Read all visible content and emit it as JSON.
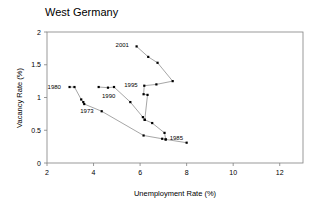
{
  "chart_data": {
    "type": "line",
    "title": "West Germany",
    "xlabel": "Unemployment Rate (%)",
    "ylabel": "Vacancy Rate (%)",
    "xlim": [
      2,
      13
    ],
    "ylim": [
      0,
      2
    ],
    "xticks": [
      2,
      4,
      6,
      8,
      10,
      12
    ],
    "xtick_labels": [
      "2",
      "4",
      "6",
      "8",
      "10",
      "12"
    ],
    "yticks": [
      0,
      0.5,
      1,
      1.5,
      2
    ],
    "ytick_labels": [
      "0",
      "0.5",
      "1",
      "1.5",
      "2"
    ],
    "grid": false,
    "legend": "none",
    "series": [
      {
        "name": "Beveridge curve 1973-2001",
        "points": [
          {
            "x": 2.97,
            "y": 1.16,
            "label": "1980"
          },
          {
            "x": 3.18,
            "y": 1.16,
            "label": ""
          },
          {
            "x": 3.47,
            "y": 0.97,
            "label": ""
          },
          {
            "x": 3.56,
            "y": 0.93,
            "label": ""
          },
          {
            "x": 3.6,
            "y": 0.9,
            "label": "1973"
          },
          {
            "x": 4.35,
            "y": 0.79,
            "label": ""
          },
          {
            "x": 6.15,
            "y": 0.42,
            "label": ""
          },
          {
            "x": 6.95,
            "y": 0.37,
            "label": ""
          },
          {
            "x": 7.1,
            "y": 0.36,
            "label": "1985"
          },
          {
            "x": 8.0,
            "y": 0.31,
            "label": ""
          }
        ]
      },
      {
        "name": "Beveridge curve branch 1990s",
        "points": [
          {
            "x": 4.22,
            "y": 1.16,
            "label": ""
          },
          {
            "x": 4.62,
            "y": 1.15,
            "label": "1990"
          },
          {
            "x": 4.88,
            "y": 1.16,
            "label": ""
          },
          {
            "x": 5.58,
            "y": 0.93,
            "label": ""
          },
          {
            "x": 6.12,
            "y": 0.7,
            "label": ""
          },
          {
            "x": 6.2,
            "y": 0.66,
            "label": ""
          },
          {
            "x": 6.52,
            "y": 0.61,
            "label": ""
          },
          {
            "x": 7.05,
            "y": 0.46,
            "label": ""
          },
          {
            "x": 7.1,
            "y": 0.36,
            "label": ""
          }
        ]
      },
      {
        "name": "Beveridge curve branch 1995-2001",
        "points": [
          {
            "x": 5.85,
            "y": 1.78,
            "label": "2001"
          },
          {
            "x": 6.35,
            "y": 1.62,
            "label": ""
          },
          {
            "x": 6.75,
            "y": 1.53,
            "label": ""
          },
          {
            "x": 7.4,
            "y": 1.25,
            "label": ""
          },
          {
            "x": 6.7,
            "y": 1.2,
            "label": ""
          },
          {
            "x": 6.18,
            "y": 1.18,
            "label": "1995"
          },
          {
            "x": 6.15,
            "y": 1.05,
            "label": ""
          },
          {
            "x": 6.32,
            "y": 1.04,
            "label": ""
          },
          {
            "x": 6.2,
            "y": 0.66,
            "label": ""
          }
        ]
      }
    ],
    "annotations": [
      {
        "text": "1980",
        "x": 2.97,
        "y": 1.16
      },
      {
        "text": "1973",
        "x": 3.6,
        "y": 0.9
      },
      {
        "text": "1990",
        "x": 4.62,
        "y": 1.15
      },
      {
        "text": "1995",
        "x": 6.18,
        "y": 1.18
      },
      {
        "text": "2001",
        "x": 5.85,
        "y": 1.78
      },
      {
        "text": "1985",
        "x": 7.1,
        "y": 0.36
      }
    ]
  },
  "colors": {
    "line": "#808080",
    "marker": "#000000",
    "axis": "#808080",
    "text": "#000000",
    "background": "#ffffff"
  }
}
